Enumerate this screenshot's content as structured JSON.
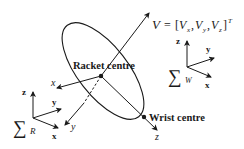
{
  "diagram": {
    "racket_centre_label": "Racket centre",
    "wrist_centre_label": "Wrist centre",
    "velocity_label": "V = [V",
    "velocity": {
      "symbol": "V",
      "equals": "=",
      "open": "[",
      "v": "V",
      "sub_x": "x",
      "sub_y": "y",
      "sub_z": "z",
      "comma": ",",
      "close": "]",
      "superscript": "T"
    },
    "racket_axes": {
      "x": "x",
      "y": "y",
      "z": "z"
    },
    "frame_R": {
      "sigma": "∑",
      "subscript": "R",
      "x": "x",
      "y": "y",
      "z": "z"
    },
    "frame_W": {
      "sigma": "∑",
      "subscript": "W",
      "x": "x",
      "y": "y",
      "z": "z"
    },
    "colors": {
      "stroke": "#1a1a1a",
      "background": "#ffffff"
    }
  }
}
